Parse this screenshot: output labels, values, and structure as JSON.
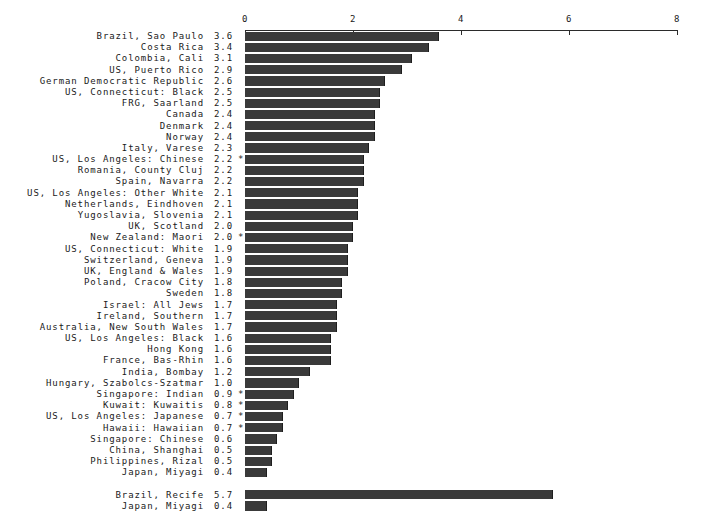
{
  "chart_data": {
    "type": "bar",
    "title": "",
    "subtitle": "",
    "xlabel": "",
    "ylabel": "",
    "orientation": "horizontal",
    "xlim": [
      0,
      8
    ],
    "xticks": [
      0,
      2,
      4,
      6,
      8
    ],
    "xtick_labels": [
      "0",
      "2",
      "4",
      "6",
      "8"
    ],
    "grid": false,
    "legend": null,
    "bar_color": "#3a3a3a",
    "axis_color": "#2b2b2b",
    "flag_symbol": "*",
    "categories": [
      "Brazil, Sao Paulo",
      "Costa Rica",
      "Colombia, Cali",
      "US, Puerto Rico",
      "German Democratic Republic",
      "US, Connecticut: Black",
      "FRG, Saarland",
      "Canada",
      "Denmark",
      "Norway",
      "Italy, Varese",
      "US, Los Angeles: Chinese",
      "Romania, County Cluj",
      "Spain, Navarra",
      "US, Los Angeles: Other White",
      "Netherlands, Eindhoven",
      "Yugoslavia, Slovenia",
      "UK, Scotland",
      "New Zealand: Maori",
      "US, Connecticut: White",
      "Switzerland, Geneva",
      "UK, England & Wales",
      "Poland, Cracow City",
      "Sweden",
      "Israel: All Jews",
      "Ireland, Southern",
      "Australia, New South Wales",
      "US, Los Angeles: Black",
      "Hong Kong",
      "France, Bas-Rhin",
      "India, Bombay",
      "Hungary, Szabolcs-Szatmar",
      "Singapore: Indian",
      "Kuwait: Kuwaitis",
      "US, Los Angeles: Japanese",
      "Hawaii: Hawaiian",
      "Singapore: Chinese",
      "China, Shanghai",
      "Philippines, Rizal",
      "Japan, Miyagi"
    ],
    "values": [
      3.6,
      3.4,
      3.1,
      2.9,
      2.6,
      2.5,
      2.5,
      2.4,
      2.4,
      2.4,
      2.3,
      2.2,
      2.2,
      2.2,
      2.1,
      2.1,
      2.1,
      2.0,
      2.0,
      1.9,
      1.9,
      1.9,
      1.8,
      1.8,
      1.7,
      1.7,
      1.7,
      1.6,
      1.6,
      1.6,
      1.2,
      1.0,
      0.9,
      0.8,
      0.7,
      0.7,
      0.6,
      0.5,
      0.5,
      0.4
    ],
    "flagged": [
      false,
      false,
      false,
      false,
      false,
      false,
      false,
      false,
      false,
      false,
      false,
      true,
      false,
      false,
      false,
      false,
      false,
      false,
      true,
      false,
      false,
      false,
      false,
      false,
      false,
      false,
      false,
      false,
      false,
      false,
      false,
      false,
      true,
      true,
      true,
      true,
      false,
      false,
      false,
      false
    ],
    "extra_categories": [
      "Brazil, Recife",
      "Japan, Miyagi"
    ],
    "extra_values": [
      5.7,
      0.4
    ],
    "extra_flagged": [
      false,
      false
    ]
  },
  "rows": [
    {
      "label": "Brazil, Sao Paulo",
      "value": "3.6",
      "num": 3.6,
      "flag": ""
    },
    {
      "label": "Costa Rica",
      "value": "3.4",
      "num": 3.4,
      "flag": ""
    },
    {
      "label": "Colombia, Cali",
      "value": "3.1",
      "num": 3.1,
      "flag": ""
    },
    {
      "label": "US, Puerto Rico",
      "value": "2.9",
      "num": 2.9,
      "flag": ""
    },
    {
      "label": "German Democratic Republic",
      "value": "2.6",
      "num": 2.6,
      "flag": ""
    },
    {
      "label": "US, Connecticut: Black",
      "value": "2.5",
      "num": 2.5,
      "flag": ""
    },
    {
      "label": "FRG, Saarland",
      "value": "2.5",
      "num": 2.5,
      "flag": ""
    },
    {
      "label": "Canada",
      "value": "2.4",
      "num": 2.4,
      "flag": ""
    },
    {
      "label": "Denmark",
      "value": "2.4",
      "num": 2.4,
      "flag": ""
    },
    {
      "label": "Norway",
      "value": "2.4",
      "num": 2.4,
      "flag": ""
    },
    {
      "label": "Italy, Varese",
      "value": "2.3",
      "num": 2.3,
      "flag": ""
    },
    {
      "label": "US, Los Angeles: Chinese",
      "value": "2.2",
      "num": 2.2,
      "flag": "*"
    },
    {
      "label": "Romania, County Cluj",
      "value": "2.2",
      "num": 2.2,
      "flag": ""
    },
    {
      "label": "Spain, Navarra",
      "value": "2.2",
      "num": 2.2,
      "flag": ""
    },
    {
      "label": "US, Los Angeles: Other White",
      "value": "2.1",
      "num": 2.1,
      "flag": ""
    },
    {
      "label": "Netherlands, Eindhoven",
      "value": "2.1",
      "num": 2.1,
      "flag": ""
    },
    {
      "label": "Yugoslavia, Slovenia",
      "value": "2.1",
      "num": 2.1,
      "flag": ""
    },
    {
      "label": "UK, Scotland",
      "value": "2.0",
      "num": 2.0,
      "flag": ""
    },
    {
      "label": "New Zealand: Maori",
      "value": "2.0",
      "num": 2.0,
      "flag": "*"
    },
    {
      "label": "US, Connecticut: White",
      "value": "1.9",
      "num": 1.9,
      "flag": ""
    },
    {
      "label": "Switzerland, Geneva",
      "value": "1.9",
      "num": 1.9,
      "flag": ""
    },
    {
      "label": "UK, England & Wales",
      "value": "1.9",
      "num": 1.9,
      "flag": ""
    },
    {
      "label": "Poland, Cracow City",
      "value": "1.8",
      "num": 1.8,
      "flag": ""
    },
    {
      "label": "Sweden",
      "value": "1.8",
      "num": 1.8,
      "flag": ""
    },
    {
      "label": "Israel: All Jews",
      "value": "1.7",
      "num": 1.7,
      "flag": ""
    },
    {
      "label": "Ireland, Southern",
      "value": "1.7",
      "num": 1.7,
      "flag": ""
    },
    {
      "label": "Australia, New South Wales",
      "value": "1.7",
      "num": 1.7,
      "flag": ""
    },
    {
      "label": "US, Los Angeles: Black",
      "value": "1.6",
      "num": 1.6,
      "flag": ""
    },
    {
      "label": "Hong Kong",
      "value": "1.6",
      "num": 1.6,
      "flag": ""
    },
    {
      "label": "France, Bas-Rhin",
      "value": "1.6",
      "num": 1.6,
      "flag": ""
    },
    {
      "label": "India, Bombay",
      "value": "1.2",
      "num": 1.2,
      "flag": ""
    },
    {
      "label": "Hungary, Szabolcs-Szatmar",
      "value": "1.0",
      "num": 1.0,
      "flag": ""
    },
    {
      "label": "Singapore: Indian",
      "value": "0.9",
      "num": 0.9,
      "flag": "*"
    },
    {
      "label": "Kuwait: Kuwaitis",
      "value": "0.8",
      "num": 0.8,
      "flag": "*"
    },
    {
      "label": "US, Los Angeles: Japanese",
      "value": "0.7",
      "num": 0.7,
      "flag": "*"
    },
    {
      "label": "Hawaii: Hawaiian",
      "value": "0.7",
      "num": 0.7,
      "flag": "*"
    },
    {
      "label": "Singapore: Chinese",
      "value": "0.6",
      "num": 0.6,
      "flag": ""
    },
    {
      "label": "China, Shanghai",
      "value": "0.5",
      "num": 0.5,
      "flag": ""
    },
    {
      "label": "Philippines, Rizal",
      "value": "0.5",
      "num": 0.5,
      "flag": ""
    },
    {
      "label": "Japan, Miyagi",
      "value": "0.4",
      "num": 0.4,
      "flag": ""
    },
    {
      "label": "",
      "value": "",
      "num": null,
      "flag": "",
      "spacer": true
    },
    {
      "label": "Brazil, Recife",
      "value": "5.7",
      "num": 5.7,
      "flag": ""
    },
    {
      "label": "Japan, Miyagi",
      "value": "0.4",
      "num": 0.4,
      "flag": ""
    }
  ]
}
